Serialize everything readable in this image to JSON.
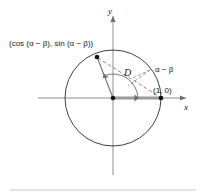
{
  "figure": {
    "type": "unit-circle-geometry-diagram",
    "background": "#ffffff",
    "width": 203,
    "height": 194,
    "axes": {
      "x_label": "x",
      "y_label": "y",
      "axis_color": "#8d8d8d",
      "origin": {
        "x": 113,
        "y": 98
      }
    },
    "circle": {
      "center_x": 113,
      "center_y": 98,
      "radius": 48,
      "stroke": "#2b2b2b"
    },
    "points": [
      {
        "name": "point-cos-sin",
        "label": "(cos (α − β), sin (α − β))",
        "x": 97,
        "y": 57
      },
      {
        "name": "point-one-zero",
        "label": "(1, 0)",
        "x": 161,
        "y": 98
      },
      {
        "name": "point-origin",
        "label": "",
        "x": 113,
        "y": 98
      }
    ],
    "chord": {
      "label": "D",
      "style": "dashed",
      "stroke": "#7a7a7a"
    },
    "angle": {
      "label": "α − β",
      "arc_stroke": "#6e6e6e",
      "leader_style": "dashed"
    },
    "radius_segments": [
      {
        "name": "radius-to-one-zero",
        "style": "thick-gray",
        "stroke": "#9a9a9a"
      },
      {
        "name": "radius-to-cos-sin",
        "style": "thin-gray",
        "stroke": "#6e6e6e"
      }
    ],
    "footer_rule": {
      "color": "#c9c9c9"
    }
  }
}
